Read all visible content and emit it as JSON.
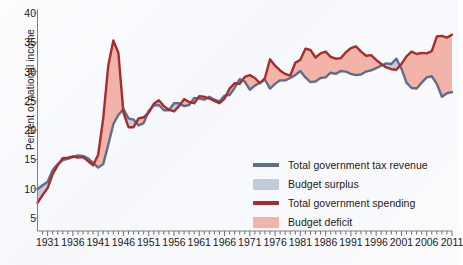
{
  "chart_data": {
    "type": "area",
    "title": "",
    "subtitle": "",
    "xlabel": "",
    "ylabel": "Percent of national income",
    "xlim": [
      1929,
      2011
    ],
    "ylim": [
      0,
      40
    ],
    "yticks": [
      5,
      10,
      15,
      20,
      25,
      30,
      35,
      40
    ],
    "xticks": [
      1931,
      1936,
      1941,
      1946,
      1951,
      1956,
      1961,
      1966,
      1971,
      1976,
      1981,
      1986,
      1991,
      1996,
      2001,
      2006,
      2011
    ],
    "grid": false,
    "legend_position": "inside-bottom-right",
    "legend": [
      {
        "label": "Total government tax revenue",
        "marker": "line",
        "color": "#5d6e8c"
      },
      {
        "label": "Budget surplus",
        "marker": "box",
        "color": "#c4cade"
      },
      {
        "label": "Total government spending",
        "marker": "line",
        "color": "#a82c2c"
      },
      {
        "label": "Budget deficit",
        "marker": "box",
        "color": "#f2b3a9"
      }
    ],
    "x": [
      1929,
      1930,
      1931,
      1932,
      1933,
      1934,
      1935,
      1936,
      1937,
      1938,
      1939,
      1940,
      1941,
      1942,
      1943,
      1944,
      1945,
      1946,
      1947,
      1948,
      1949,
      1950,
      1951,
      1952,
      1953,
      1954,
      1955,
      1956,
      1957,
      1958,
      1959,
      1960,
      1961,
      1962,
      1963,
      1964,
      1965,
      1966,
      1967,
      1968,
      1969,
      1970,
      1971,
      1972,
      1973,
      1974,
      1975,
      1976,
      1977,
      1978,
      1979,
      1980,
      1981,
      1982,
      1983,
      1984,
      1985,
      1986,
      1987,
      1988,
      1989,
      1990,
      1991,
      1992,
      1993,
      1994,
      1995,
      1996,
      1997,
      1998,
      1999,
      2000,
      2001,
      2002,
      2003,
      2004,
      2005,
      2006,
      2007,
      2008,
      2009,
      2010,
      2011
    ],
    "series": [
      {
        "name": "Total government tax revenue",
        "color": "#5d6e8c",
        "values": [
          9.9,
          10.6,
          11.2,
          13.2,
          14.2,
          14.9,
          15.1,
          15.4,
          15.7,
          15.6,
          15.2,
          14.4,
          13.6,
          14.2,
          17.5,
          21.0,
          22.6,
          23.6,
          22.0,
          21.8,
          20.8,
          21.2,
          23.3,
          24.2,
          24.3,
          23.4,
          23.4,
          24.6,
          24.6,
          24.1,
          24.3,
          25.5,
          25.4,
          25.2,
          25.7,
          25.2,
          24.9,
          25.9,
          26.0,
          27.2,
          28.7,
          28.3,
          26.9,
          27.6,
          28.1,
          28.6,
          27.1,
          27.9,
          28.5,
          28.5,
          28.9,
          29.4,
          30.1,
          29.0,
          28.2,
          28.3,
          28.9,
          29.0,
          29.8,
          29.6,
          30.1,
          30.0,
          29.6,
          29.4,
          29.5,
          30.0,
          30.2,
          30.6,
          31.0,
          31.4,
          31.3,
          32.2,
          30.5,
          28.1,
          27.2,
          27.1,
          28.1,
          29.0,
          29.2,
          27.9,
          25.7,
          26.3,
          26.5
        ]
      },
      {
        "name": "Total government spending",
        "color": "#a82c2c",
        "values": [
          7.6,
          8.9,
          10.1,
          12.5,
          14.0,
          15.2,
          15.3,
          15.5,
          15.3,
          15.4,
          14.7,
          14.0,
          15.8,
          22.0,
          31.0,
          35.3,
          33.2,
          23.0,
          20.5,
          20.5,
          22.0,
          22.2,
          23.0,
          24.5,
          25.1,
          24.1,
          23.5,
          23.2,
          24.1,
          25.3,
          24.8,
          24.6,
          25.8,
          25.7,
          25.4,
          25.0,
          24.6,
          25.4,
          27.1,
          28.0,
          27.9,
          29.1,
          29.4,
          28.9,
          28.0,
          28.9,
          32.1,
          31.0,
          30.2,
          29.6,
          29.3,
          31.5,
          32.0,
          33.9,
          33.7,
          32.4,
          33.1,
          33.4,
          32.5,
          32.2,
          32.3,
          33.3,
          34.0,
          34.3,
          33.4,
          32.7,
          32.8,
          32.0,
          31.3,
          30.7,
          30.4,
          30.3,
          31.3,
          32.6,
          33.4,
          33.0,
          33.2,
          33.1,
          33.5,
          36.0,
          36.1,
          35.8,
          36.3
        ]
      }
    ],
    "fills": [
      {
        "name": "Budget surplus",
        "condition": "tax_revenue > spending",
        "color": "#c4cade"
      },
      {
        "name": "Budget deficit",
        "condition": "spending > tax_revenue",
        "color": "#f2b3a9"
      }
    ]
  }
}
